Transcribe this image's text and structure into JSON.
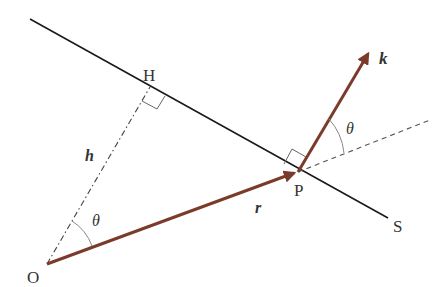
{
  "diagram": {
    "labels": {
      "H": "H",
      "h": "h",
      "O": "O",
      "P": "P",
      "S": "S",
      "r": "r",
      "k": "k",
      "theta_top": "θ",
      "theta_bottom": "θ"
    },
    "colors": {
      "vector": "#7a3b2a",
      "line": "#1a1a1a",
      "dashed": "#555555",
      "arc": "#888888"
    },
    "points": {
      "O": [
        47,
        264
      ],
      "H": [
        150,
        87
      ],
      "P": [
        298,
        172
      ],
      "k_tip": [
        370,
        50
      ],
      "line_start": [
        30,
        19
      ],
      "line_end": [
        388,
        218
      ],
      "dash_end": [
        430,
        120
      ]
    }
  }
}
